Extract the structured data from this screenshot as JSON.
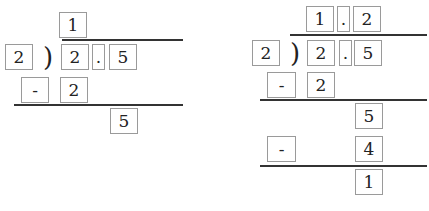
{
  "left": {
    "quotient": [
      "1"
    ],
    "divisor": "2",
    "dividend": [
      "2",
      ".",
      "5"
    ],
    "step1": {
      "op": "-",
      "value": "2"
    },
    "remainder1": "5"
  },
  "right": {
    "quotient": [
      "1",
      ".",
      "2"
    ],
    "divisor": "2",
    "dividend": [
      "2",
      ".",
      "5"
    ],
    "step1": {
      "op": "-",
      "value": "2"
    },
    "carry": "5",
    "step2": {
      "op": "-",
      "value": "4"
    },
    "remainder": "1"
  },
  "symbols": {
    "bracket": ")"
  }
}
